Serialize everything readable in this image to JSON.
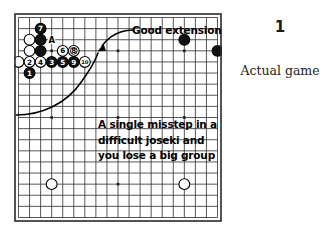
{
  "figure": {
    "number": "1",
    "caption": "Actual game"
  },
  "annotations": {
    "good_extension": "Good extension",
    "misstep_lines": [
      "A single misstep in a",
      "difficult joseki and",
      "you lose a big group"
    ]
  },
  "board": {
    "size": 19,
    "line_color": "#3a3a3a",
    "border_color": "#2a2a2a",
    "background": "#ffffff",
    "star_points": [
      {
        "col": 3,
        "row": 3
      },
      {
        "col": 9,
        "row": 3
      },
      {
        "col": 15,
        "row": 3
      },
      {
        "col": 3,
        "row": 9
      },
      {
        "col": 9,
        "row": 9
      },
      {
        "col": 15,
        "row": 9
      },
      {
        "col": 3,
        "row": 15
      },
      {
        "col": 9,
        "row": 15
      },
      {
        "col": 15,
        "row": 15
      }
    ],
    "plain_stones": [
      {
        "col": 1,
        "row": 2,
        "color": "white"
      },
      {
        "col": 1,
        "row": 3,
        "color": "white"
      },
      {
        "col": 0,
        "row": 4,
        "color": "white"
      },
      {
        "col": 2,
        "row": 2,
        "color": "black"
      },
      {
        "col": 2,
        "row": 3,
        "color": "black"
      },
      {
        "col": 15,
        "row": 2,
        "color": "black"
      },
      {
        "col": 18,
        "row": 3,
        "color": "black"
      },
      {
        "col": 3,
        "row": 15,
        "color": "white"
      },
      {
        "col": 15,
        "row": 15,
        "color": "white"
      }
    ],
    "numbered_stones": [
      {
        "label": "1",
        "col": 1,
        "row": 5,
        "color": "black"
      },
      {
        "label": "2",
        "col": 1,
        "row": 4,
        "color": "white"
      },
      {
        "label": "3",
        "col": 3,
        "row": 4,
        "color": "black"
      },
      {
        "label": "4",
        "col": 2,
        "row": 4,
        "color": "white"
      },
      {
        "label": "5",
        "col": 4,
        "row": 4,
        "color": "black"
      },
      {
        "label": "6",
        "col": 4,
        "row": 3,
        "color": "white"
      },
      {
        "label": "7",
        "col": 2,
        "row": 1,
        "color": "black"
      },
      {
        "label": "8",
        "col": 5,
        "row": 3,
        "color": "white",
        "marked": true
      },
      {
        "label": "9",
        "col": 5,
        "row": 4,
        "color": "black"
      },
      {
        "label": "10",
        "col": 6,
        "row": 4,
        "color": "white"
      }
    ],
    "letter_markers": [
      {
        "label": "A",
        "col": 3,
        "row": 2
      }
    ]
  }
}
